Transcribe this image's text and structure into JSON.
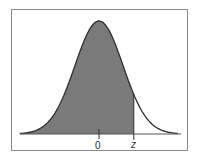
{
  "chart_data": {
    "type": "area",
    "title": "",
    "xlabel": "",
    "ylabel": "",
    "distribution": {
      "name": "standard normal",
      "mean": 0,
      "sd": 1
    },
    "x_range": [
      -3.3,
      3.3
    ],
    "shaded_region": {
      "from": "-inf",
      "to": "z",
      "approx_z": 1.45
    },
    "tick_labels": [
      {
        "position": 0,
        "label": "0"
      },
      {
        "position": "z",
        "label": "z"
      }
    ],
    "grid": false,
    "legend": null
  },
  "colors": {
    "fill": "#7a7a7a",
    "curve": "#2e2e2e",
    "frame": "#8a8a8a",
    "baseline": "#555555"
  },
  "labels": {
    "zero": "0",
    "z": "z"
  }
}
